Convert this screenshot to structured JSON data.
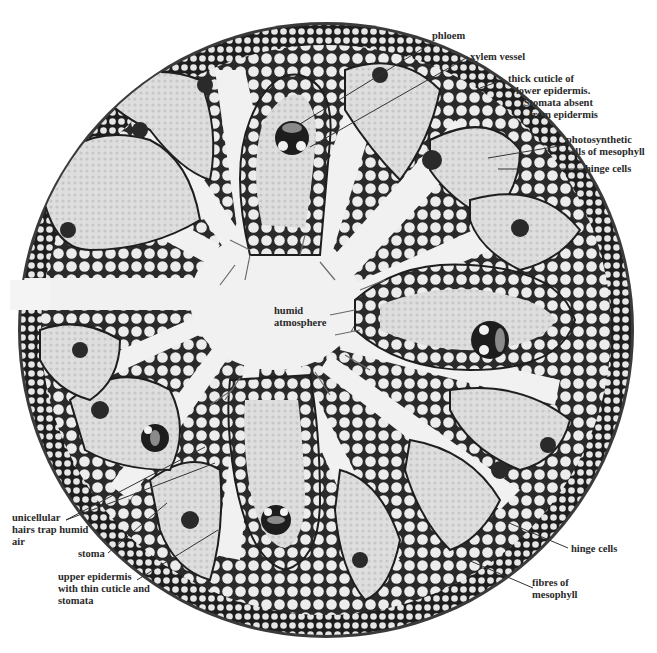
{
  "figure": {
    "colors": {
      "background": "#ffffff",
      "cuticle": "#2b2b2b",
      "fibre_cells": "#e4e4e4",
      "fibre_walls": "#1e1e1e",
      "mesophyll": "#d9d9d9",
      "groove_space": "#f0f0f0",
      "label_text": "#2a2a2a",
      "leader_line": "#333333"
    }
  },
  "labels": {
    "phloem": "phloem",
    "xylem_vessel": "xylem vessel",
    "thick_cuticle": "thick cuticle of\n   lower epidermis.\n      Stomata absent\n        from epidermis",
    "photosynthetic": "photosynthetic\ncells of mesophyll",
    "hinge_cells_top": "hinge cells",
    "humid_atmosphere": "humid\natmosphere",
    "unicellular_hairs": "unicellular\nhairs trap humid\nair",
    "stoma": "stoma",
    "upper_epidermis": "upper epidermis\nwith thin cuticle and\nstomata",
    "hinge_cells_bottom": "hinge cells",
    "fibres_of_mesophyll": "fibres of\nmesophyll"
  }
}
